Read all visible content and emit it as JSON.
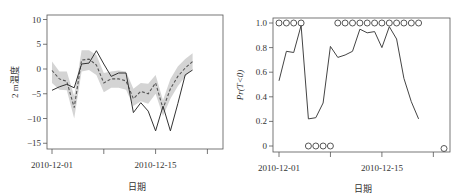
{
  "chart_data": [
    {
      "type": "line",
      "title": "",
      "xlabel": "日期",
      "ylabel": "2 m温度",
      "ylim": [
        -15,
        10
      ],
      "yticks": [
        -15,
        -10,
        -5,
        0,
        5,
        10
      ],
      "xticks": [
        {
          "day": 0,
          "label": "2010-12-01"
        },
        {
          "day": 7,
          "label": ""
        },
        {
          "day": 14,
          "label": "2010-12-15"
        },
        {
          "day": 21,
          "label": ""
        }
      ],
      "x_start_date": "2010-12-01",
      "days": [
        0,
        1,
        2,
        3,
        4,
        5,
        6,
        7,
        8,
        9,
        10,
        11,
        12,
        13,
        14,
        15,
        16,
        17,
        18,
        19,
        20,
        21,
        22
      ],
      "series": [
        {
          "name": "observed",
          "style": "solid",
          "values": [
            -4.3,
            -3.6,
            -3.1,
            -3.8,
            1.0,
            1.2,
            3.7,
            1.0,
            -1.5,
            -0.8,
            -0.8,
            -8.8,
            -6.8,
            -8.5,
            -12.5,
            -7.5,
            -12.5,
            -7.0,
            -1.2,
            -0.2,
            null,
            null,
            null
          ]
        },
        {
          "name": "forecast-mean",
          "style": "dashed",
          "values": [
            -0.3,
            -2.0,
            -2.5,
            -7.8,
            1.8,
            2.0,
            0.8,
            -2.8,
            -2.0,
            -2.0,
            -2.4,
            -6.0,
            -4.5,
            -5.0,
            -2.8,
            -8.0,
            -4.0,
            -1.5,
            0.2,
            1.5,
            null,
            null,
            null
          ]
        },
        {
          "name": "forecast-spread",
          "style": "band",
          "lower": [
            -2.8,
            -4.2,
            -4.3,
            -10.0,
            -0.5,
            -0.2,
            -1.2,
            -4.7,
            -3.8,
            -3.8,
            -4.2,
            -7.5,
            -6.5,
            -7.0,
            -5.0,
            -9.5,
            -6.0,
            -3.5,
            -1.5,
            0.0,
            null,
            null,
            null
          ],
          "upper": [
            1.5,
            -0.5,
            -0.5,
            -5.5,
            3.8,
            3.8,
            2.8,
            -0.8,
            -0.5,
            -0.3,
            -0.5,
            -4.0,
            -2.8,
            -3.0,
            -1.2,
            -6.3,
            -2.0,
            0.5,
            2.0,
            3.2,
            null,
            null,
            null
          ]
        }
      ]
    },
    {
      "type": "line",
      "title": "",
      "xlabel": "日期",
      "ylabel": "Pr(T<0)",
      "ylim": [
        0,
        1.0
      ],
      "yticks": [
        0,
        0.2,
        0.4,
        0.6,
        0.8,
        1.0
      ],
      "ytick_labels": [
        "0",
        "0.2",
        "0.4",
        "0.6",
        "0.8",
        "1.0"
      ],
      "xticks": [
        {
          "day": 0,
          "label": "2010-12-01"
        },
        {
          "day": 7,
          "label": ""
        },
        {
          "day": 14,
          "label": "2010-12-15"
        },
        {
          "day": 21,
          "label": ""
        }
      ],
      "x_start_date": "2010-12-01",
      "days": [
        0,
        1,
        2,
        3,
        4,
        5,
        6,
        7,
        8,
        9,
        10,
        11,
        12,
        13,
        14,
        15,
        16,
        17,
        18,
        19,
        20,
        21,
        22
      ],
      "series": [
        {
          "name": "probability",
          "style": "solid",
          "values": [
            0.53,
            0.77,
            0.76,
            0.98,
            0.22,
            0.23,
            0.35,
            0.81,
            0.72,
            0.74,
            0.77,
            0.95,
            0.92,
            0.93,
            0.8,
            0.97,
            0.87,
            0.55,
            0.36,
            0.22,
            null,
            null,
            null
          ]
        },
        {
          "name": "observed-event",
          "style": "circles",
          "values": [
            1,
            1,
            1,
            1,
            0,
            0,
            0,
            0,
            1,
            1,
            1,
            1,
            1,
            1,
            1,
            1,
            1,
            1,
            1,
            1,
            -0.02,
            null,
            null
          ]
        }
      ]
    }
  ],
  "labels": {
    "left_ylabel": "2 m温度",
    "right_ylabel_pr": "Pr",
    "right_ylabel_rest": "(T<0)",
    "xlabel": "日期",
    "date1": "2010-12-01",
    "date2": "2010-12-15"
  }
}
